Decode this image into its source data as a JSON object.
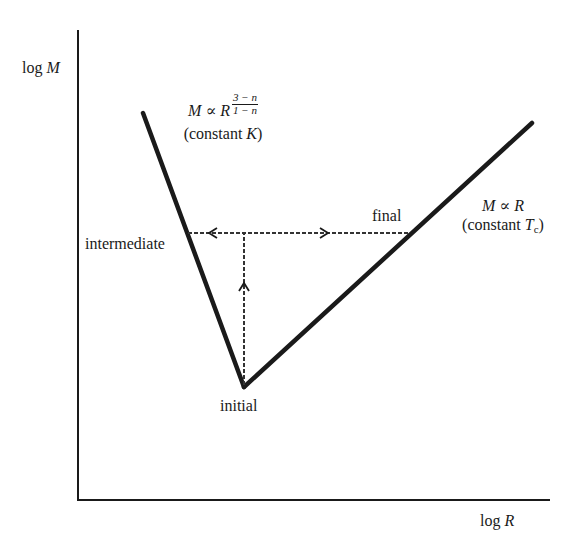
{
  "diagram": {
    "axes": {
      "y_label_prefix": "log",
      "y_label_var": "M",
      "x_label_prefix": "log",
      "x_label_var": "R"
    },
    "left_branch": {
      "relation_lhs": "M",
      "relation_sym": "∝",
      "relation_rhs": "R",
      "exponent_num": "3 − n",
      "exponent_den": "1 − n",
      "condition_prefix": "(constant ",
      "condition_var": "K",
      "condition_suffix": ")"
    },
    "right_branch": {
      "relation_lhs": "M",
      "relation_sym": "∝",
      "relation_rhs": "R",
      "condition_prefix": "(constant ",
      "condition_var": "T",
      "condition_sub": "c",
      "condition_suffix": ")"
    },
    "points": {
      "initial": "initial",
      "intermediate": "intermediate",
      "final": "final"
    },
    "colors": {
      "line": "#1a1a1a",
      "dashed": "#333333",
      "background": "#ffffff"
    }
  }
}
